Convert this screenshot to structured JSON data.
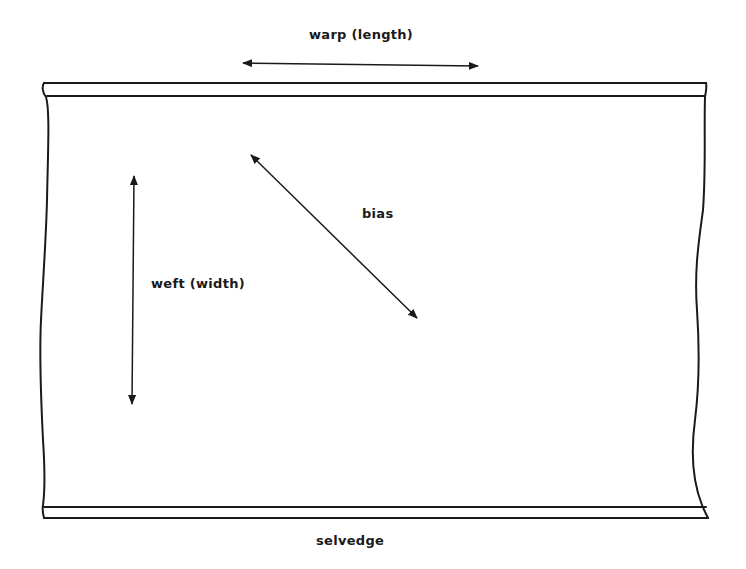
{
  "diagram": {
    "labels": {
      "warp": "warp (length)",
      "bias": "bias",
      "weft": "weft (width)",
      "selvedge": "selvedge"
    },
    "elements": [
      {
        "name": "warp-arrow",
        "type": "double-arrow",
        "direction": "horizontal",
        "label": "warp (length)"
      },
      {
        "name": "weft-arrow",
        "type": "double-arrow",
        "direction": "vertical",
        "label": "weft (width)"
      },
      {
        "name": "bias-arrow",
        "type": "double-arrow",
        "direction": "diagonal",
        "label": "bias"
      },
      {
        "name": "top-selvedge",
        "type": "band",
        "position": "top"
      },
      {
        "name": "bottom-selvedge",
        "type": "band",
        "position": "bottom",
        "label": "selvedge"
      },
      {
        "name": "fabric-piece",
        "type": "rectangle-wavy-sides"
      }
    ],
    "colors": {
      "stroke": "#1a1a1a",
      "background": "#ffffff"
    }
  }
}
